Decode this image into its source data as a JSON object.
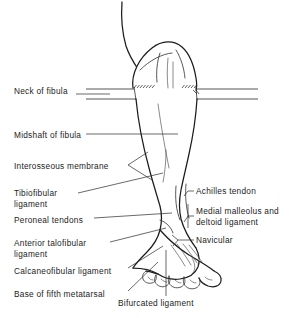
{
  "figure": {
    "background_color": "#ffffff",
    "ink_color": "#1c1c1c",
    "leader_color": "#2a2a2a"
  },
  "labels_left": [
    {
      "id": "neck-of-fibula",
      "text": "Neck of fibula",
      "x": 14,
      "y": 86
    },
    {
      "id": "midshaft-of-fibula",
      "text": "Midshaft of fibula",
      "x": 14,
      "y": 130
    },
    {
      "id": "interosseous-membrane",
      "text": "Interosseous membrane",
      "x": 14,
      "y": 161
    },
    {
      "id": "tibiofibular-ligament",
      "text": "Tibiofibular\nligament",
      "x": 14,
      "y": 188
    },
    {
      "id": "peroneal-tendons",
      "text": "Peroneal tendons",
      "x": 14,
      "y": 215
    },
    {
      "id": "anterior-talofibular-ligament",
      "text": "Anterior talofibular\nligament",
      "x": 14,
      "y": 238
    },
    {
      "id": "calcaneofibular-ligament",
      "text": "Calcaneofibular ligament",
      "x": 14,
      "y": 266
    },
    {
      "id": "base-of-fifth-metatarsal",
      "text": "Base of fifth metatarsal",
      "x": 14,
      "y": 289
    }
  ],
  "labels_right": [
    {
      "id": "achilles-tendon",
      "text": "Achilles tendon",
      "x": 196,
      "y": 189
    },
    {
      "id": "medial-malleolus-and-deltoid-ligament",
      "text": "Medial malleolus and\ndeltoid ligament",
      "x": 196,
      "y": 209
    },
    {
      "id": "navicular",
      "text": "Navicular",
      "x": 196,
      "y": 237
    }
  ],
  "labels_bottom": [
    {
      "id": "bifurcated-ligament",
      "text": "Bifurcated ligament",
      "x": 118,
      "y": 303
    }
  ],
  "section_rules": {
    "upper_y": 89,
    "lower_y": 99,
    "left_start": 86,
    "right_end": 258
  }
}
